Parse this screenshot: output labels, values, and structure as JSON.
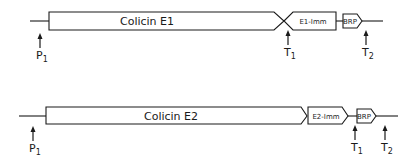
{
  "operons": [
    {
      "id": "e1",
      "main_gene": "Colicin E1",
      "immunity_gene": "E1-Imm",
      "lysis_gene": "BRP",
      "sites": [
        {
          "letter": "P",
          "sub": "1"
        },
        {
          "letter": "T",
          "sub": "1"
        },
        {
          "letter": "T",
          "sub": "2"
        }
      ]
    },
    {
      "id": "e2",
      "main_gene": "Colicin E2",
      "immunity_gene": "E2-Imm",
      "lysis_gene": "BRP",
      "sites": [
        {
          "letter": "P",
          "sub": "1"
        },
        {
          "letter": "T",
          "sub": "1"
        },
        {
          "letter": "T",
          "sub": "2"
        }
      ]
    }
  ],
  "colors": {
    "line": "#1a1a1a",
    "background": "#ffffff"
  }
}
